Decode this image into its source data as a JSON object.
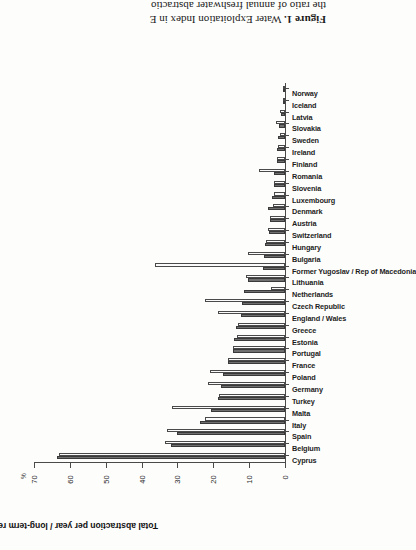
{
  "figure": {
    "caption_label": "Figure 1.",
    "caption_line1": " Water Exploitation Index in E",
    "caption_line2": "the ratio of annual freshwater abstractio"
  },
  "chart_data": {
    "type": "bar",
    "title": "",
    "xlabel": "",
    "ylabel": "Total abstraction per year / long-term renewable resource",
    "unit": "%",
    "ylim": [
      0,
      70
    ],
    "yticks": [
      0,
      10,
      20,
      30,
      40,
      50,
      60,
      70
    ],
    "ytick_labels": [
      "0",
      "10",
      "20",
      "30",
      "40",
      "50",
      "60",
      "70"
    ],
    "grid": false,
    "legend_position": "none",
    "orientation": "vertical-bars-on-rotated-page",
    "categories": [
      "Cyprus",
      "Belgium",
      "Spain",
      "Italy",
      "Malta",
      "Turkey",
      "Germany",
      "Poland",
      "France",
      "Portugal",
      "Estonia",
      "Greece",
      "England / Wales",
      "Czech Republic",
      "Netherlands",
      "Lithuania",
      "Former Yugoslav / Rep of Macedonia",
      "Bulgaria",
      "Hungary",
      "Switzerland",
      "Austria",
      "Denmark",
      "Luxembourg",
      "Slovenia",
      "Romania",
      "Finland",
      "Ireland",
      "Sweden",
      "Slovakia",
      "Latvia",
      "Iceland",
      "Norway"
    ],
    "series": [
      {
        "name": "earlier year",
        "color": "#6f6f6f",
        "values": [
          63.5,
          31.8,
          30.2,
          23.8,
          20.6,
          18.6,
          17.8,
          17.3,
          15.9,
          14.6,
          14.3,
          13.8,
          12.2,
          12.0,
          11.5,
          10.3,
          6.2,
          6.0,
          5.5,
          4.6,
          4.3,
          4.7,
          3.5,
          3.2,
          3.1,
          2.2,
          2.3,
          1.9,
          1.6,
          1.2,
          0.5,
          0.6
        ]
      },
      {
        "name": "later year",
        "color": "#fbfbfb",
        "values": [
          63.0,
          33.6,
          32.9,
          22.2,
          31.6,
          18.4,
          21.5,
          20.9,
          15.9,
          14.4,
          13.4,
          13.0,
          18.6,
          22.2,
          4.0,
          10.8,
          36.3,
          10.3,
          5.3,
          4.8,
          4.2,
          3.4,
          3.0,
          3.0,
          7.2,
          2.1,
          1.9,
          1.5,
          2.6,
          1.5,
          0.5,
          0.6
        ]
      }
    ]
  }
}
